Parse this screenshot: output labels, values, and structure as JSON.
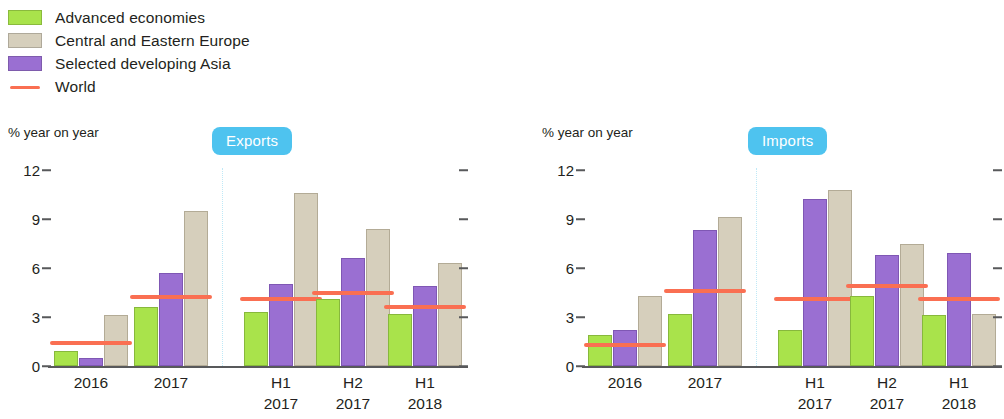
{
  "legend": {
    "items": [
      {
        "label": "Advanced economies",
        "color": "#a9e34b",
        "marker": "square"
      },
      {
        "label": "Central and Eastern Europe",
        "color": "#d6cfbc",
        "marker": "square"
      },
      {
        "label": "Selected developing Asia",
        "color": "#9a6fd2",
        "marker": "square"
      },
      {
        "label": "World",
        "color": "#fa6f52",
        "marker": "line"
      }
    ]
  },
  "panels": [
    {
      "badge": "Exports",
      "axis_title": "% year on year"
    },
    {
      "badge": "Imports",
      "axis_title": "% year on year"
    }
  ],
  "chart_data": [
    {
      "type": "bar",
      "title": "Exports",
      "ylabel": "% year on year",
      "xlabel": "",
      "ylim": [
        0,
        12
      ],
      "yticks": [
        0,
        3,
        6,
        9,
        12
      ],
      "ytick_labels": [
        "0",
        "3",
        "6",
        "9",
        "12"
      ],
      "grid": false,
      "legend_position": "top-left",
      "categories": [
        "2016",
        "2017",
        "H1 2017",
        "H2 2017",
        "H1 2018"
      ],
      "category_lines": [
        [
          "2016"
        ],
        [
          "2017"
        ],
        [
          "H1",
          "2017"
        ],
        [
          "H2",
          "2017"
        ],
        [
          "H1",
          "2018"
        ]
      ],
      "series": [
        {
          "name": "Advanced economies",
          "color": "#a9e34b",
          "values": [
            0.9,
            3.6,
            3.3,
            4.1,
            3.2
          ]
        },
        {
          "name": "Selected developing Asia",
          "color": "#9a6fd2",
          "values": [
            0.5,
            5.7,
            5.0,
            6.6,
            4.9
          ]
        },
        {
          "name": "Central and Eastern Europe",
          "color": "#d6cfbc",
          "values": [
            3.1,
            9.5,
            10.6,
            8.4,
            6.3
          ]
        }
      ],
      "overlay": {
        "name": "World",
        "type": "line-marker",
        "color": "#fa6f52",
        "values": [
          1.4,
          4.2,
          4.1,
          4.5,
          3.6
        ]
      }
    },
    {
      "type": "bar",
      "title": "Imports",
      "ylabel": "% year on year",
      "xlabel": "",
      "ylim": [
        0,
        12
      ],
      "yticks": [
        0,
        3,
        6,
        9,
        12
      ],
      "ytick_labels": [
        "0",
        "3",
        "6",
        "9",
        "12"
      ],
      "grid": false,
      "legend_position": "top-left",
      "categories": [
        "2016",
        "2017",
        "H1 2017",
        "H2 2017",
        "H1 2018"
      ],
      "category_lines": [
        [
          "2016"
        ],
        [
          "2017"
        ],
        [
          "H1",
          "2017"
        ],
        [
          "H2",
          "2017"
        ],
        [
          "H1",
          "2018"
        ]
      ],
      "series": [
        {
          "name": "Advanced economies",
          "color": "#a9e34b",
          "values": [
            1.9,
            3.2,
            2.2,
            4.3,
            3.1
          ]
        },
        {
          "name": "Selected developing Asia",
          "color": "#9a6fd2",
          "values": [
            2.2,
            8.3,
            10.2,
            6.8,
            6.9
          ]
        },
        {
          "name": "Central and Eastern Europe",
          "color": "#d6cfbc",
          "values": [
            4.3,
            9.1,
            10.8,
            7.5,
            3.2
          ]
        }
      ],
      "overlay": {
        "name": "World",
        "type": "line-marker",
        "color": "#fa6f52",
        "values": [
          1.3,
          4.6,
          4.1,
          4.9,
          4.1
        ]
      }
    }
  ],
  "colors": {
    "advanced": "#a9e34b",
    "cee": "#d6cfbc",
    "asia": "#9a6fd2",
    "world": "#fa6f52",
    "badge": "#4ec3ef",
    "axis": "#58595b",
    "divider": "#bfe9f7"
  }
}
